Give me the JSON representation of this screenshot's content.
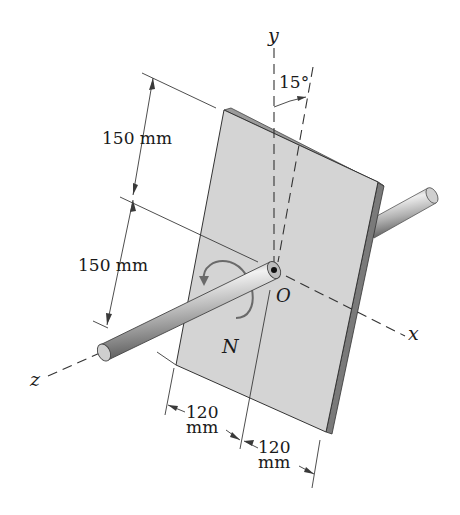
{
  "figure": {
    "labels": {
      "axis_y": "y",
      "axis_x": "x",
      "axis_z": "z",
      "origin": "O",
      "moment": "N",
      "angle": "15°"
    },
    "dimensions": {
      "upper_height": "150 mm",
      "lower_height": "150 mm",
      "left_width_value": "120",
      "left_width_unit": "mm",
      "right_width_value": "120",
      "right_width_unit": "mm"
    },
    "colors": {
      "plate_face": "#d4d4d4",
      "plate_edge": "#7a7a7a",
      "plate_top_edge": "#9a9a9a",
      "rod_light": "#e8e8e8",
      "rod_dark": "#6e6e6e",
      "line": "#3a3a3a"
    }
  }
}
